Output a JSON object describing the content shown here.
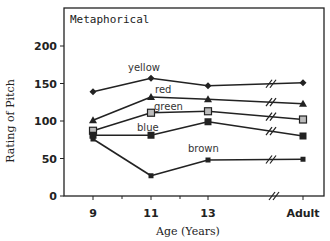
{
  "chart_data": {
    "type": "line",
    "title": "Metaphorical",
    "xlabel": "Age (Years)",
    "ylabel": "Rating of Pitch",
    "categories": [
      "9",
      "11",
      "13",
      "Adult"
    ],
    "ylim": [
      0,
      200
    ],
    "yticks": [
      0,
      50,
      100,
      150,
      200
    ],
    "grid": false,
    "legend": "inline labels",
    "axis_break": "between 13 and Adult",
    "series": [
      {
        "name": "yellow",
        "marker": "diamond",
        "values": [
          139,
          157,
          147,
          151
        ]
      },
      {
        "name": "red",
        "marker": "triangle",
        "values": [
          101,
          132,
          129,
          123
        ]
      },
      {
        "name": "green",
        "marker": "open-square",
        "values": [
          87,
          111,
          113,
          102
        ]
      },
      {
        "name": "blue",
        "marker": "filled-square",
        "values": [
          81,
          81,
          99,
          80
        ]
      },
      {
        "name": "brown",
        "marker": "small-square",
        "values": [
          76,
          27,
          48,
          49
        ]
      }
    ]
  }
}
